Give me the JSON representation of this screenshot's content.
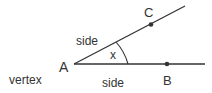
{
  "diagram": {
    "type": "angle",
    "labels": {
      "vertex_point": "A",
      "point_upper": "C",
      "point_lower": "B",
      "angle": "x",
      "side_upper": "side",
      "side_lower": "side",
      "vertex": "vertex"
    },
    "colors": {
      "line": "#333333",
      "text": "#333333"
    }
  }
}
